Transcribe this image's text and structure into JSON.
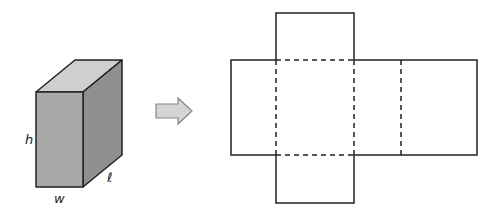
{
  "diagram": {
    "box": {
      "labels": {
        "height": "h",
        "width": "w",
        "length": "ℓ"
      },
      "colors": {
        "front": "#a9a9a9",
        "top": "#cfcfcf",
        "side": "#8f8f8f",
        "edge": "#222222"
      }
    },
    "arrow": {
      "direction": "right",
      "fill": "#d4d4d4",
      "stroke": "#888888"
    },
    "net": {
      "description": "Unfolded net of rectangular prism",
      "line_color": "#222222"
    }
  }
}
